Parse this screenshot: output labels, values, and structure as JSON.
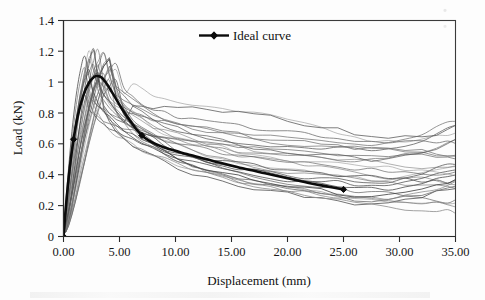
{
  "figure": {
    "background": "#fdfdfd",
    "frame_color": "#3b3b3b",
    "ideal_color": "#0b0b0b",
    "specimen_color": "#555555"
  },
  "legend": {
    "position": "top-center",
    "entries": [
      {
        "label": "Ideal curve",
        "marker": "diamond",
        "color": "#0b0b0b"
      }
    ]
  },
  "axes": {
    "x": {
      "label": "Displacement  (mm)",
      "ticks": [
        "0.00",
        "5.00",
        "10.00",
        "15.00",
        "20.00",
        "25.00",
        "30.00",
        "35.00"
      ],
      "values": [
        0,
        5,
        10,
        15,
        20,
        25,
        30,
        35
      ],
      "min": 0,
      "max": 35
    },
    "y": {
      "label": "Load (kN)",
      "ticks": [
        "0",
        "0.2",
        "0.4",
        "0.6",
        "0.8",
        "1",
        "1.2",
        "1.4"
      ],
      "values": [
        0,
        0.2,
        0.4,
        0.6,
        0.8,
        1.0,
        1.2,
        1.4
      ],
      "min": 0,
      "max": 1.4
    }
  },
  "chart_data": {
    "type": "line",
    "title": "",
    "xlabel": "Displacement  (mm)",
    "ylabel": "Load (kN)",
    "xlim": [
      0,
      35
    ],
    "ylim": [
      0,
      1.4
    ],
    "grid": false,
    "legend_position": "top-center",
    "series": [
      {
        "name": "Ideal curve",
        "emphasis": true,
        "color": "#0b0b0b",
        "marker": "diamond",
        "marker_x": [
          0,
          1,
          7,
          25
        ],
        "x": [
          0,
          0.25,
          0.55,
          0.9,
          1.3,
          1.8,
          2.3,
          2.75,
          3.0,
          3.4,
          3.9,
          4.5,
          5.2,
          6.0,
          7.0,
          8.2,
          9.5,
          11.0,
          12.5,
          14.0,
          16.0,
          18.0,
          20.0,
          22.0,
          23.5,
          25.0
        ],
        "y": [
          0.0,
          0.22,
          0.44,
          0.63,
          0.79,
          0.92,
          1.0,
          1.035,
          1.04,
          1.03,
          0.985,
          0.915,
          0.83,
          0.745,
          0.655,
          0.6,
          0.565,
          0.535,
          0.505,
          0.478,
          0.442,
          0.41,
          0.378,
          0.345,
          0.325,
          0.305
        ]
      },
      {
        "name": "specimen-group",
        "emphasis": false,
        "color": "#555555",
        "count": 28,
        "description": "Twenty-eight individual specimen load-displacement traces forming a scatter band around the ideal curve.",
        "peak_load_range": [
          0.9,
          1.24
        ],
        "peak_displacement_range": [
          2.0,
          5.0
        ],
        "tail_load_range": [
          0.07,
          0.6
        ],
        "tail_displacement": 35
      }
    ]
  }
}
